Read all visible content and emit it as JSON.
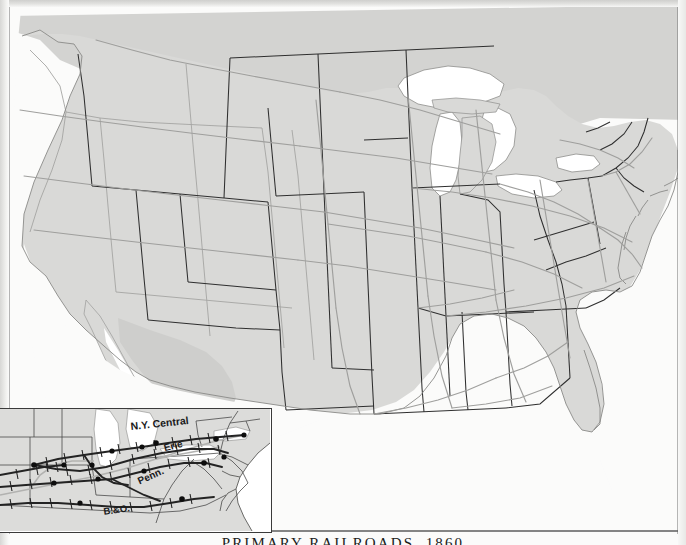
{
  "figure": {
    "caption": "PRIMARY RAILROADS, 1860",
    "type": "historical-thematic-map",
    "region": "United States"
  },
  "colors": {
    "land": "#d9d9d7",
    "land_shadow": "#cdcdcb",
    "water": "#ffffff",
    "state_border": "#2e2e2e",
    "region_border": "#9a9a98",
    "railroad_main": "#9d9d9b",
    "railroad_inset": "#242424",
    "city_dot": "#101010",
    "margin_rule": "#6f6f6f",
    "caption_text": "#1b1b1b"
  },
  "main_map": {
    "name": "united-states-1860",
    "features": [
      "state-boundaries",
      "coastline",
      "great-lakes",
      "rail-network"
    ],
    "water_bodies": [
      "Lake Superior",
      "Lake Michigan",
      "Lake Huron",
      "Lake Erie",
      "Lake Ontario",
      "Atlantic Ocean",
      "Gulf of Mexico",
      "Pacific Ocean"
    ]
  },
  "inset_map": {
    "name": "trunk-line-detail",
    "title": "",
    "railroad_labels": [
      {
        "id": "ny-central",
        "text": "N.Y. Central",
        "x": 160,
        "y": 18,
        "rotate": -6
      },
      {
        "id": "erie",
        "text": "Erie",
        "x": 172,
        "y": 40,
        "rotate": -13
      },
      {
        "id": "penn",
        "text": "Penn.",
        "x": 151,
        "y": 68,
        "rotate": -22
      },
      {
        "id": "bando",
        "text": "B.&O.",
        "x": 116,
        "y": 101,
        "rotate": -9
      }
    ],
    "city_dot_count": 14,
    "legend_note": "hatched lines = primary trunk railroads; dots = terminal cities"
  }
}
